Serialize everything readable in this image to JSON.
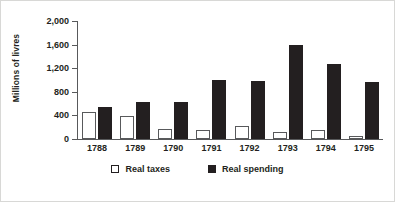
{
  "chart_data": {
    "type": "bar",
    "title": "",
    "subtitle": "",
    "xlabel": "",
    "ylabel": "Millions of livres",
    "categories": [
      "1788",
      "1789",
      "1790",
      "1791",
      "1792",
      "1793",
      "1794",
      "1795"
    ],
    "series": [
      {
        "name": "Real taxes",
        "color": "#ffffff",
        "edge_color": "#58595b",
        "values": [
          460,
          390,
          165,
          150,
          225,
          120,
          155,
          55
        ]
      },
      {
        "name": "Real spending",
        "color": "#231f20",
        "edge_color": "#231f20",
        "values": [
          545,
          630,
          635,
          1000,
          985,
          1590,
          1270,
          970
        ]
      }
    ],
    "ylim": [
      0,
      2000
    ],
    "ytick_values": [
      0,
      400,
      800,
      1200,
      1600,
      2000
    ],
    "ytick_labels": [
      "0",
      "400",
      "800",
      "1,200",
      "1,600",
      "2,000"
    ],
    "grid": false,
    "legend_position": "bottom-center"
  },
  "legend": {
    "items": [
      {
        "label": "Real taxes",
        "marker": "hollow-square"
      },
      {
        "label": "Real spending",
        "marker": "solid-square"
      }
    ]
  },
  "colors": {
    "axis": "#58595b",
    "text": "#231f20",
    "background": "#ffffff",
    "border": "#d8d8d6"
  }
}
